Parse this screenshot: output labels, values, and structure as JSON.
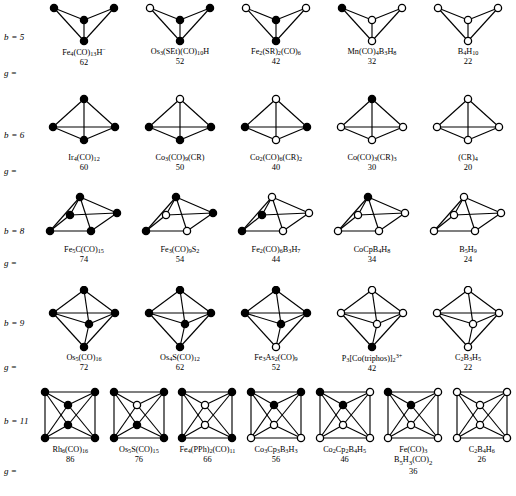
{
  "figure": {
    "kind": "cluster-geometry-table",
    "vertex_legend": {
      "filled": "transition-metal vertex",
      "open": "main-group vertex"
    },
    "row_label_prefix": "b =",
    "g_label": "g ="
  },
  "chart_data": {
    "type": "table",
    "xlabel": "",
    "ylabel": "",
    "row_headers": [
      "b = 5",
      "b = 6",
      "b = 8",
      "b = 9",
      "b = 11"
    ],
    "column_header": "g =",
    "rows": [
      {
        "b_label": "b = 5",
        "geometry": "butterfly",
        "entries": [
          {
            "formula_html": "Fe<sub>4</sub>(CO)<sub>13</sub>H<sup>−</sup>",
            "g": "62"
          },
          {
            "formula_html": "Os<sub>3</sub>(SEt)(CO)<sub>10</sub>H",
            "g": "52"
          },
          {
            "formula_html": "Fe<sub>2</sub>(SR)<sub>2</sub>(CO)<sub>6</sub>",
            "g": "42"
          },
          {
            "formula_html": "Mn(CO)<sub>4</sub>B<sub>3</sub>H<sub>8</sub>",
            "g": "32"
          },
          {
            "formula_html": "B<sub>4</sub>H<sub>10</sub>",
            "g": "22"
          }
        ]
      },
      {
        "b_label": "b = 6",
        "geometry": "tetrahedron",
        "entries": [
          {
            "formula_html": "Ir<sub>4</sub>(CO)<sub>12</sub>",
            "g": "60"
          },
          {
            "formula_html": "Co<sub>3</sub>(CO)<sub>9</sub>(CR)",
            "g": "50"
          },
          {
            "formula_html": "Co<sub>2</sub>(CO)<sub>6</sub>(CR)<sub>2</sub>",
            "g": "40"
          },
          {
            "formula_html": "Co(CO)<sub>3</sub>(CR)<sub>3</sub>",
            "g": "30"
          },
          {
            "formula_html": "(CR)<sub>4</sub>",
            "g": "20"
          }
        ]
      },
      {
        "b_label": "b = 8",
        "geometry": "square-pyramid",
        "entries": [
          {
            "formula_html": "Fe<sub>5</sub>C(CO)<sub>15</sub>",
            "g": "74"
          },
          {
            "formula_html": "Fe<sub>3</sub>(CO)<sub>9</sub>S<sub>2</sub>",
            "g": "54"
          },
          {
            "formula_html": "Fe<sub>2</sub>(CO)<sub>6</sub>B<sub>3</sub>H<sub>7</sub>",
            "g": "44"
          },
          {
            "formula_html": "CoCpB<sub>4</sub>H<sub>8</sub>",
            "g": "34"
          },
          {
            "formula_html": "B<sub>5</sub>H<sub>9</sub>",
            "g": "24"
          }
        ]
      },
      {
        "b_label": "b = 9",
        "geometry": "trigonal-bipyramid",
        "entries": [
          {
            "formula_html": "Os<sub>5</sub>(CO)<sub>16</sub>",
            "g": "72"
          },
          {
            "formula_html": "Os<sub>4</sub>S(CO)<sub>12</sub>",
            "g": "62"
          },
          {
            "formula_html": "Fe<sub>3</sub>As<sub>2</sub>(CO)<sub>9</sub>",
            "g": "52"
          },
          {
            "formula_html": "P<sub>3</sub>[Co(triphos)]<sub>2</sub><sup>3+</sup>",
            "g": "42"
          },
          {
            "formula_html": "C<sub>2</sub>B<sub>3</sub>H<sub>5</sub>",
            "g": "22"
          }
        ]
      },
      {
        "b_label": "b = 11",
        "geometry": "octahedron",
        "entries": [
          {
            "formula_html": "Rh<sub>6</sub>(CO)<sub>16</sub>",
            "g": "86"
          },
          {
            "formula_html": "Os<sub>5</sub>S(CO)<sub>15</sub>",
            "g": "76"
          },
          {
            "formula_html": "Fe<sub>4</sub>(PPh)<sub>2</sub>(CO)<sub>11</sub>",
            "g": "66"
          },
          {
            "formula_html": "Co<sub>3</sub>Cp<sub>3</sub>B<sub>3</sub>H<sub>3</sub>",
            "g": "56"
          },
          {
            "formula_html": "Co<sub>2</sub>Cp<sub>2</sub>B<sub>4</sub>H<sub>5</sub>",
            "g": "46"
          },
          {
            "formula_html": "Fe(CO)<sub>3</sub>",
            "formula_html_line2": "B<sub>5</sub>H<sub>3</sub>(CO)<sub>2</sub>",
            "g": "36"
          },
          {
            "formula_html": "C<sub>2</sub>B<sub>4</sub>H<sub>6</sub>",
            "g": "26"
          }
        ]
      }
    ],
    "vertex_fill_patterns": {
      "butterfly_order": "[left-wing, center-hinge, right-wing, bottom-hinge]",
      "row1": [
        [
          "f",
          "f",
          "f",
          "f"
        ],
        [
          "o",
          "f",
          "f",
          "f"
        ],
        [
          "o",
          "f",
          "o",
          "f"
        ],
        [
          "f",
          "o",
          "o",
          "o"
        ],
        [
          "o",
          "o",
          "o",
          "o"
        ]
      ],
      "tetra_order": "[apex, left-base, front-base, right-base]",
      "row2": [
        [
          "f",
          "f",
          "f",
          "f"
        ],
        [
          "o",
          "f",
          "f",
          "f"
        ],
        [
          "o",
          "f",
          "o",
          "f"
        ],
        [
          "f",
          "o",
          "o",
          "o"
        ],
        [
          "o",
          "o",
          "o",
          "o"
        ]
      ],
      "sqpyr_order": "[apex, back-left, back-right, front-left, front-right]",
      "row3": [
        [
          "f",
          "f",
          "f",
          "f",
          "f"
        ],
        [
          "f",
          "o",
          "f",
          "f",
          "o"
        ],
        [
          "o",
          "f",
          "o",
          "f",
          "o"
        ],
        [
          "f",
          "o",
          "o",
          "o",
          "o"
        ],
        [
          "o",
          "o",
          "o",
          "o",
          "o"
        ]
      ],
      "tbp_order": "[top-axial, left-eq, right-eq, front-eq, bottom-axial]",
      "row4": [
        [
          "f",
          "f",
          "f",
          "f",
          "f"
        ],
        [
          "f",
          "f",
          "f",
          "f",
          "f"
        ],
        [
          "f",
          "f",
          "f",
          "f",
          "o"
        ],
        [
          "o",
          "o",
          "o",
          "o",
          "f"
        ],
        [
          "o",
          "o",
          "o",
          "o",
          "o"
        ]
      ],
      "oct_order": "[top-left, top-right, bottom-left, bottom-right, center-upper, center-lower]",
      "row5": [
        [
          "f",
          "f",
          "f",
          "f",
          "f",
          "f"
        ],
        [
          "f",
          "f",
          "f",
          "f",
          "o",
          "f"
        ],
        [
          "f",
          "f",
          "f",
          "f",
          "o",
          "o"
        ],
        [
          "f",
          "f",
          "o",
          "o",
          "f",
          "o"
        ],
        [
          "f",
          "o",
          "o",
          "o",
          "f",
          "o"
        ],
        [
          "f",
          "o",
          "o",
          "o",
          "f",
          "o"
        ],
        [
          "o",
          "o",
          "o",
          "o",
          "o",
          "o"
        ]
      ]
    }
  }
}
